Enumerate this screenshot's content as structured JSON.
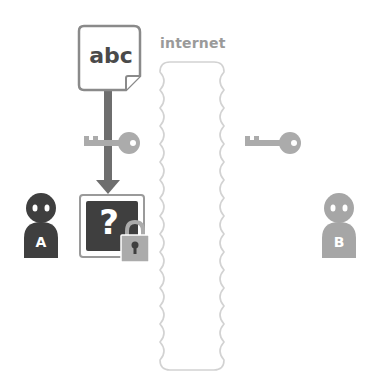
{
  "diagram": {
    "document": {
      "text": "abc",
      "icon": "document-icon"
    },
    "network": {
      "label": "internet"
    },
    "encrypted_box": {
      "symbol": "?",
      "icon": "locked-box-icon"
    },
    "sender": {
      "letter": "A",
      "color": "#3f3f3f"
    },
    "receiver": {
      "letter": "B",
      "color": "#a6a6a6"
    },
    "keys": [
      {
        "owner": "A",
        "icon": "key-icon",
        "color": "#ababab"
      },
      {
        "owner": "B",
        "icon": "key-icon",
        "color": "#ababab"
      }
    ],
    "colors": {
      "dark": "#3f3f3f",
      "mid_gray": "#ababab",
      "arrow": "#6e6e6e",
      "light_outline": "#cfcfcf",
      "label": "#9a9a9a"
    }
  }
}
